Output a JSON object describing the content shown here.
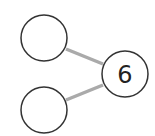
{
  "diagram": {
    "type": "number-bond",
    "whole": {
      "label": "6"
    },
    "parts": [
      {
        "label": ""
      },
      {
        "label": ""
      }
    ],
    "colors": {
      "stroke": "#333333",
      "connector": "#aaaaaa",
      "background": "#ffffff"
    }
  }
}
